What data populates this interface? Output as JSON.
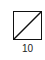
{
  "diagram": {
    "cell": {
      "shape": "square",
      "mark": "diagonal-slash",
      "stroke_color": "#111111",
      "label": "10"
    }
  }
}
